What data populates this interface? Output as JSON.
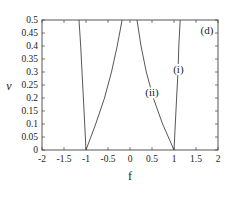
{
  "chart_data": {
    "type": "line",
    "title": "",
    "panel_label": "(d)",
    "xlabel": "f",
    "ylabel": "v",
    "xlim": [
      -2,
      2
    ],
    "ylim": [
      0,
      0.5
    ],
    "grid": false,
    "legend": "none (curves annotated inline)",
    "x_ticks": [
      "-2",
      "-1.5",
      "-1",
      "-0.5",
      "0",
      "0.5",
      "1",
      "1.5",
      "2"
    ],
    "y_ticks": [
      "0",
      "0.05",
      "0.1",
      "0.15",
      "0.2",
      "0.25",
      "0.3",
      "0.35",
      "0.4",
      "0.45",
      "0.5"
    ],
    "series": [
      {
        "name": "(i)",
        "branches": [
          {
            "x": [
              -1.0,
              -1.03,
              -1.06,
              -1.09,
              -1.12,
              -1.16
            ],
            "y": [
              0.0,
              0.1,
              0.2,
              0.3,
              0.4,
              0.5
            ]
          },
          {
            "x": [
              1.0,
              1.03,
              1.06,
              1.09,
              1.11,
              1.14
            ],
            "y": [
              0.0,
              0.1,
              0.2,
              0.3,
              0.4,
              0.5
            ]
          }
        ]
      },
      {
        "name": "(ii)",
        "branches": [
          {
            "x": [
              -1.0,
              -0.78,
              -0.58,
              -0.42,
              -0.29,
              -0.18
            ],
            "y": [
              0.0,
              0.1,
              0.2,
              0.3,
              0.4,
              0.5
            ]
          },
          {
            "x": [
              1.0,
              0.74,
              0.53,
              0.37,
              0.25,
              0.16
            ],
            "y": [
              0.0,
              0.1,
              0.2,
              0.3,
              0.4,
              0.5
            ]
          }
        ]
      }
    ],
    "annotations": [
      {
        "text": "(i)",
        "x": 1.1,
        "y": 0.3
      },
      {
        "text": "(ii)",
        "x": 0.5,
        "y": 0.21
      },
      {
        "text": "(d)",
        "x": 1.75,
        "y": 0.45
      }
    ]
  }
}
